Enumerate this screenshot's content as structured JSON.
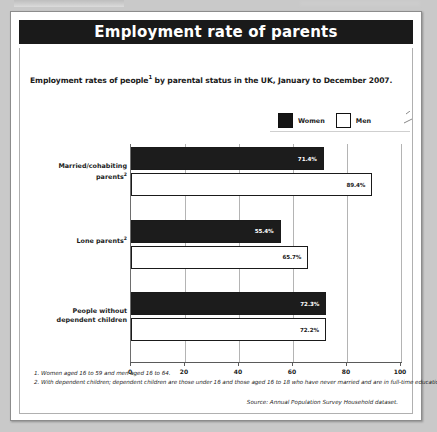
{
  "panel": {
    "title": "Employment rate of parents",
    "subtitle_prefix": "Employment rates of people",
    "subtitle_sup": "1",
    "subtitle_suffix": " by parental status in the UK, January to December 2007.",
    "subtitle_full": "Employment rates of people1 by parental status in the UK, January to December 2007."
  },
  "legend": {
    "women_label": "Women",
    "men_label": "Men",
    "women_color": "#151515",
    "men_color": "#ffffff"
  },
  "footnotes": [
    "1. Women aged 16 to 59 and men aged 16 to 64.",
    "2. With dependent children; dependent children are those under 16 and those aged 16 to 18 who have never married and are in full-time education."
  ],
  "source": "Source: Annual Population Survey Household dataset.",
  "chart_data": {
    "type": "bar",
    "orientation": "horizontal",
    "title": "Employment rate of parents",
    "subtitle": "Employment rates of people1 by parental status in the UK, January to December 2007.",
    "xlabel": "",
    "ylabel": "",
    "xlim": [
      0,
      100
    ],
    "xticks": [
      "0",
      "20",
      "40",
      "60",
      "80",
      "100"
    ],
    "grid": true,
    "legend_position": "top-right",
    "categories": [
      "Married/cohabiting parents2",
      "Lone parents2",
      "People without dependent children"
    ],
    "category_lines": [
      [
        "Married/cohabiting",
        "parents",
        "2"
      ],
      [
        "Lone parents",
        "",
        "2"
      ],
      [
        "People without",
        "dependent children",
        ""
      ]
    ],
    "series": [
      {
        "name": "Women",
        "color": "#1c1c1c",
        "values": [
          71.4,
          55.4,
          72.3
        ],
        "labels": [
          "71.4%",
          "55.4%",
          "72.3%"
        ]
      },
      {
        "name": "Men",
        "color": "#ffffff",
        "values": [
          89.4,
          65.7,
          72.2
        ],
        "labels": [
          "89.4%",
          "65.7%",
          "72.2%"
        ]
      }
    ]
  }
}
